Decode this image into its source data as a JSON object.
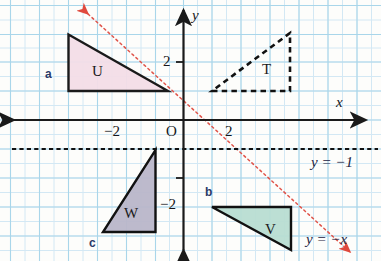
{
  "diagram": {
    "colors": {
      "grid_minor": "#cfe6f2",
      "grid_major": "#a8d4e8",
      "axis": "#1a1a1a",
      "triangle_u_fill": "#f3dde7",
      "triangle_u_stroke": "#1a1a1a",
      "triangle_t_stroke": "#111111",
      "triangle_w_fill": "#b9b6c9",
      "triangle_w_stroke": "#111111",
      "triangle_v_fill": "#b8ddd2",
      "triangle_v_stroke": "#111111",
      "mirror_line": "#e0544a",
      "dashed_line": "#111111",
      "part_label": "#2b3a68",
      "background": "#fdfdfb"
    },
    "axes": {
      "x_axis_label": "x",
      "y_axis_label": "y",
      "origin_label": "O",
      "x_ticks": [
        {
          "label": "−2",
          "value": -2
        },
        {
          "label": "2",
          "value": 2
        }
      ],
      "y_ticks": [
        {
          "label": "2",
          "value": 2
        },
        {
          "label": "−2",
          "value": -2
        }
      ]
    },
    "lines": [
      {
        "name": "horizontal-dashed-line",
        "label": "y = −1",
        "style": "dashed",
        "color": "#111111"
      },
      {
        "name": "mirror-line",
        "label": "y = −x",
        "style": "dotted",
        "color": "#e0544a",
        "arrows": "both"
      }
    ],
    "shapes": [
      {
        "name": "triangle-u",
        "label": "U",
        "fill": "#f3dde7",
        "stroke": "#1a1a1a",
        "style": "solid",
        "vertices": [
          [
            -4,
            2.2
          ],
          [
            -4,
            0.6
          ],
          [
            -0.1,
            0.6
          ]
        ],
        "right_angle_at": "bottom-left"
      },
      {
        "name": "triangle-t",
        "label": "T",
        "fill": "none",
        "stroke": "#111111",
        "style": "dashed",
        "vertices": [
          [
            1,
            1
          ],
          [
            3.7,
            1
          ],
          [
            3.7,
            3
          ]
        ],
        "right_angle_at": "bottom-right"
      },
      {
        "name": "triangle-w",
        "label": "W",
        "fill": "#b9b6c9",
        "stroke": "#111111",
        "style": "solid",
        "vertices": [
          [
            -1,
            -1
          ],
          [
            -1,
            -3.85
          ],
          [
            -2.75,
            -3.85
          ]
        ],
        "right_angle_at": "bottom-right"
      },
      {
        "name": "triangle-v",
        "label": "V",
        "fill": "#b8ddd2",
        "stroke": "#111111",
        "style": "solid",
        "vertices": [
          [
            1,
            -3
          ],
          [
            3.7,
            -3
          ],
          [
            3.7,
            -4.4
          ]
        ],
        "right_angle_at": "top-right"
      }
    ],
    "part_labels": [
      {
        "name": "part-label-a",
        "label": "a"
      },
      {
        "name": "part-label-b",
        "label": "b"
      },
      {
        "name": "part-label-c",
        "label": "c"
      }
    ]
  }
}
